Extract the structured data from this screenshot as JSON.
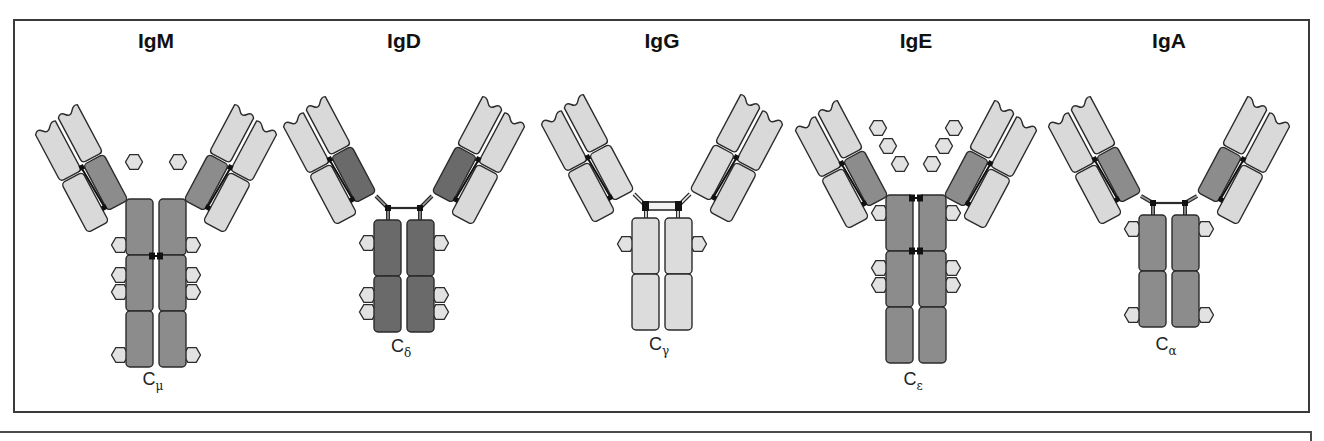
{
  "figure": {
    "colors": {
      "light_domain": "#d9d9d9",
      "constant_dark": "#6a6a6a",
      "constant_mid": "#8c8c8c",
      "constant_light": "#dcdcdc",
      "outline": "#2b2b2b",
      "carbohydrate": "#e2e2e2",
      "disulfide": "#111111"
    },
    "antibodies": [
      {
        "name": "IgM",
        "constant_label": "C",
        "constant_sub": "μ",
        "cx": 156,
        "title_y": 48,
        "stem_top": 199,
        "stem_domains": 3,
        "domain_h": 56,
        "stem_color": "constant_mid",
        "ch1_color": "constant_mid",
        "hinge": "none",
        "arm_pivot_y": 200,
        "arm_angle": 28,
        "interchain_bonds_y": [
          256
        ],
        "stem_hexagons": [
          [
            0,
            46
          ],
          [
            1,
            20
          ],
          [
            1,
            37
          ],
          [
            2,
            44
          ]
        ],
        "arm_hexagons": [
          [
            -22,
            162
          ],
          [
            22,
            162
          ]
        ],
        "label_y": 385
      },
      {
        "name": "IgD",
        "constant_label": "C",
        "constant_sub": "δ",
        "cx": 404,
        "title_y": 48,
        "stem_top": 220,
        "stem_domains": 2,
        "domain_h": 56,
        "stem_color": "constant_dark",
        "ch1_color": "constant_dark",
        "hinge": "long",
        "arm_pivot_y": 192,
        "arm_angle": 28,
        "interchain_bonds_y": [],
        "stem_hexagons": [
          [
            0,
            23
          ],
          [
            1,
            19
          ],
          [
            1,
            36
          ]
        ],
        "arm_hexagons": [],
        "label_y": 352
      },
      {
        "name": "IgG",
        "constant_label": "C",
        "constant_sub": "γ",
        "cx": 662,
        "title_y": 48,
        "stem_top": 218,
        "stem_domains": 2,
        "domain_h": 56,
        "stem_color": "constant_light",
        "ch1_color": "constant_light",
        "hinge": "double",
        "arm_pivot_y": 190,
        "arm_angle": 28,
        "interchain_bonds_y": [],
        "stem_hexagons": [
          [
            0,
            26
          ]
        ],
        "arm_hexagons": [],
        "label_y": 350
      },
      {
        "name": "IgE",
        "constant_label": "C",
        "constant_sub": "ε",
        "cx": 916,
        "title_y": 48,
        "stem_top": 195,
        "stem_domains": 3,
        "domain_h": 56,
        "stem_color": "constant_mid",
        "ch1_color": "constant_mid",
        "hinge": "none",
        "arm_pivot_y": 196,
        "arm_angle": 28,
        "interchain_bonds_y": [
          198,
          251
        ],
        "stem_hexagons": [
          [
            0,
            18
          ],
          [
            1,
            17
          ],
          [
            1,
            34
          ]
        ],
        "arm_hexagons": [
          [
            -38,
            128
          ],
          [
            -28,
            146
          ],
          [
            -16,
            164
          ],
          [
            38,
            128
          ],
          [
            28,
            146
          ],
          [
            16,
            164
          ]
        ],
        "label_y": 385
      },
      {
        "name": "IgA",
        "constant_label": "C",
        "constant_sub": "α",
        "cx": 1169,
        "title_y": 48,
        "stem_top": 215,
        "stem_domains": 2,
        "domain_h": 56,
        "stem_color": "constant_mid",
        "ch1_color": "constant_mid",
        "hinge": "long",
        "arm_pivot_y": 192,
        "arm_angle": 28,
        "interchain_bonds_y": [],
        "stem_hexagons": [
          [
            0,
            14
          ],
          [
            1,
            44
          ]
        ],
        "arm_hexagons": [],
        "label_y": 350
      }
    ]
  }
}
